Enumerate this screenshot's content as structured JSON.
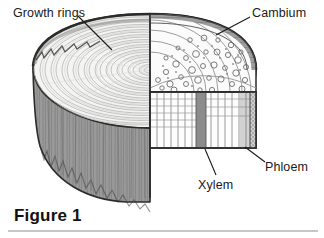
{
  "figure": {
    "caption": "Figure 1",
    "background_color": "#ffffff",
    "rule_color": "#b5b5b5"
  },
  "labels": [
    {
      "id": "growth-rings",
      "text": "Growth rings",
      "position": "top-left",
      "leader": {
        "from_x": 78,
        "from_y": 16,
        "to_x": 112,
        "to_y": 50
      }
    },
    {
      "id": "cambium",
      "text": "Cambium",
      "position": "top-right",
      "leader": {
        "from_x": 250,
        "from_y": 17,
        "to_x": 216,
        "to_y": 35
      }
    },
    {
      "id": "xylem",
      "text": "Xylem",
      "position": "bottom-center",
      "leader": {
        "from_x": 205,
        "from_y": 149,
        "to_x": 215,
        "to_y": 175
      }
    },
    {
      "id": "phloem",
      "text": "Phloem",
      "position": "bottom-right",
      "leader": {
        "from_x": 245,
        "from_y": 147,
        "to_x": 264,
        "to_y": 163
      }
    }
  ],
  "colors": {
    "outline": "#2b2b2b",
    "bark_side": "#9a9a9a",
    "bark_side_dark": "#7e7e7e",
    "heartwood": "#f4f4f2",
    "ring_line": "#b9b9b9",
    "wedge_fill": "#fbfbfb",
    "cambium_band": "#8c8c8c",
    "cell_line": "#8e8e8e",
    "phloem_strip": "#a8a8a8",
    "bark_top": "#8f8f8f",
    "label_text": "#1a1a1a"
  },
  "anatomy": {
    "layers": [
      {
        "name": "Growth rings",
        "description": "concentric annual rings in heartwood"
      },
      {
        "name": "Cambium",
        "description": "thin dividing layer between xylem and phloem"
      },
      {
        "name": "Xylem",
        "description": "water-conducting wood tissue, inner columnar cells"
      },
      {
        "name": "Phloem",
        "description": "food-conducting tissue just inside the bark"
      }
    ],
    "ring_count": 26
  }
}
